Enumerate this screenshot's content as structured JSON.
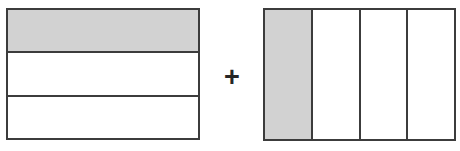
{
  "diagram": {
    "background_color": "#ffffff",
    "shade_color": "#d2d2d2",
    "line_color": "#3c3c3c",
    "operator": {
      "symbol": "+",
      "name": "plus-operator"
    },
    "figures": [
      {
        "name": "figure-thirds",
        "shape": "rectangle",
        "orientation": "horizontal-bands",
        "total_parts": 3,
        "shaded_parts": 1,
        "fraction": "1/3",
        "parts": [
          {
            "index": 1,
            "shaded": true,
            "label": ""
          },
          {
            "index": 2,
            "shaded": false,
            "label": ""
          },
          {
            "index": 3,
            "shaded": false,
            "label": ""
          }
        ]
      },
      {
        "name": "figure-fourths",
        "shape": "rectangle",
        "orientation": "vertical-strips",
        "total_parts": 4,
        "shaded_parts": 1,
        "fraction": "1/4",
        "parts": [
          {
            "index": 1,
            "shaded": true,
            "label": ""
          },
          {
            "index": 2,
            "shaded": false,
            "label": ""
          },
          {
            "index": 3,
            "shaded": false,
            "label": ""
          },
          {
            "index": 4,
            "shaded": false,
            "label": ""
          }
        ]
      }
    ]
  }
}
